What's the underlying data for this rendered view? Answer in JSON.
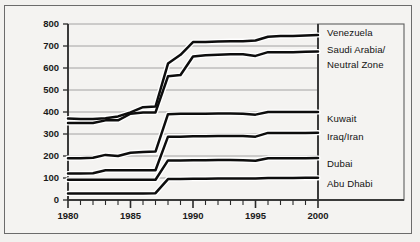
{
  "figure": {
    "ylabel": "Billions of Barrels",
    "frame": true
  },
  "chart_data": {
    "type": "line",
    "title": "",
    "xlabel": "",
    "ylabel": "Billions of Barrels",
    "xlim": [
      1980,
      2000
    ],
    "ylim": [
      0,
      800
    ],
    "ytick_labels": [
      "0",
      "100",
      "200",
      "300",
      "400",
      "500",
      "600",
      "700",
      "800"
    ],
    "ytick_values": [
      0,
      100,
      200,
      300,
      400,
      500,
      600,
      700,
      800
    ],
    "xtick_labels": [
      "1980",
      "1985",
      "1990",
      "1995",
      "2000"
    ],
    "xtick_values": [
      1980,
      1985,
      1990,
      1995,
      2000
    ],
    "minor_xticks": "every 1 year",
    "grid": "horizontal",
    "legend_position": "right-outside-labels",
    "x": [
      1980,
      1981,
      1982,
      1983,
      1984,
      1985,
      1986,
      1987,
      1988,
      1989,
      1990,
      1991,
      1992,
      1993,
      1994,
      1995,
      1996,
      1997,
      1998,
      1999,
      2000
    ],
    "series": [
      {
        "name": "Venezuela",
        "values": [
          370,
          368,
          368,
          372,
          380,
          398,
          422,
          425,
          620,
          660,
          718,
          718,
          720,
          722,
          722,
          725,
          742,
          745,
          746,
          748,
          750
        ]
      },
      {
        "name": "Saudi Arabia/Neutral Zone",
        "values": [
          350,
          350,
          350,
          362,
          362,
          392,
          398,
          398,
          562,
          568,
          652,
          658,
          660,
          662,
          662,
          655,
          672,
          672,
          672,
          674,
          675
        ]
      },
      {
        "name": "Kuwait",
        "values": [
          190,
          190,
          192,
          205,
          200,
          215,
          218,
          220,
          390,
          392,
          392,
          392,
          393,
          393,
          392,
          388,
          400,
          400,
          400,
          400,
          400
        ]
      },
      {
        "name": "Iraq/Iran",
        "values": [
          120,
          120,
          122,
          135,
          135,
          135,
          135,
          135,
          288,
          288,
          290,
          290,
          291,
          291,
          291,
          288,
          305,
          305,
          305,
          305,
          306
        ]
      },
      {
        "name": "Dubai",
        "values": [
          92,
          92,
          92,
          92,
          92,
          92,
          92,
          92,
          180,
          180,
          181,
          181,
          182,
          182,
          181,
          178,
          190,
          190,
          190,
          190,
          191
        ]
      },
      {
        "name": "Abu Dhabi",
        "values": [
          30,
          30,
          30,
          30,
          30,
          30,
          30,
          31,
          95,
          96,
          97,
          97,
          98,
          98,
          98,
          98,
          100,
          100,
          100,
          101,
          101
        ]
      }
    ]
  },
  "legend": {
    "entries": [
      {
        "label": "Venezuela"
      },
      {
        "label": "Saudi Arabia/"
      },
      {
        "label": "Neutral Zone"
      },
      {
        "label": "Kuwait"
      },
      {
        "label": "Iraq/Iran"
      },
      {
        "label": "Dubai"
      },
      {
        "label": "Abu Dhabi"
      }
    ]
  }
}
